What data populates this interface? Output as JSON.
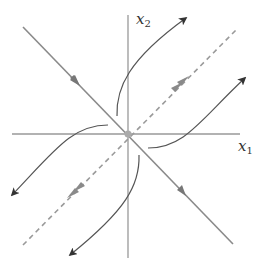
{
  "figure": {
    "type": "phase-portrait",
    "background": "#ffffff"
  },
  "axes": {
    "x_label": {
      "var": "x",
      "sub": "1"
    },
    "y_label": {
      "var": "x",
      "sub": "2"
    },
    "color": "#999999"
  },
  "origin": {
    "label": "equilibrium",
    "color": "#aaaaaa"
  },
  "eigenlines": {
    "stable": {
      "style": "solid",
      "direction": "toward origin",
      "color": "#8a8a8a"
    },
    "unstable": {
      "style": "dashed",
      "direction": "away from origin",
      "color": "#9a9a9a"
    }
  },
  "trajectories": {
    "count": 4,
    "color": "#555555",
    "arrowheads": [
      "upper-right",
      "right",
      "lower-left",
      "bottom-left"
    ]
  }
}
